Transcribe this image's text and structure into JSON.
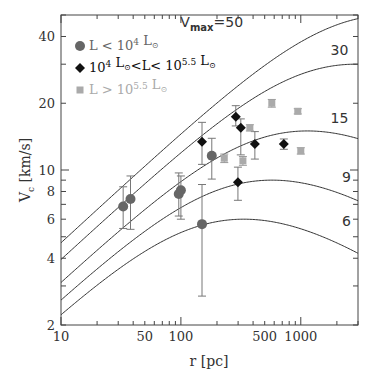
{
  "chart_data": {
    "type": "scatter",
    "title": "",
    "header_text_cropped": "James Bullock",
    "xlabel": "r [pc]",
    "ylabel": "V_c [km/s]",
    "xscale": "log",
    "yscale": "log",
    "xlim": [
      10,
      3000
    ],
    "ylim": [
      2,
      50
    ],
    "xticks": [
      10,
      50,
      100,
      500,
      1000
    ],
    "xtick_labels": [
      "10",
      "50",
      "100",
      "500",
      "1000"
    ],
    "yticks": [
      2,
      4,
      6,
      8,
      10,
      20,
      40
    ],
    "ytick_labels": [
      "2",
      "4",
      "6",
      "8",
      "10",
      "20",
      "40"
    ],
    "grid": false,
    "legend_position": "top-left",
    "series": [
      {
        "name": "L < 10^4 L_sun",
        "legend_parts": [
          "L < 10",
          "4",
          " L",
          "⊙"
        ],
        "marker": "circle",
        "color": "#666666",
        "points": [
          {
            "x": 33,
            "y": 6.85,
            "ylo": 5.45,
            "yhi": 8.4
          },
          {
            "x": 38,
            "y": 7.4,
            "ylo": 5.4,
            "yhi": 9.4
          },
          {
            "x": 96,
            "y": 7.8,
            "ylo": 6.2,
            "yhi": 9.7
          },
          {
            "x": 100,
            "y": 8.1,
            "ylo": 6.0,
            "yhi": 9.4
          },
          {
            "x": 150,
            "y": 5.7,
            "ylo": 2.7,
            "yhi": 8.6
          },
          {
            "x": 181,
            "y": 11.6,
            "ylo": 9.1,
            "yhi": 13.9
          }
        ]
      },
      {
        "name": "10^4 L_sun < L < 10^5.5 L_sun",
        "legend_parts": [
          "10",
          "4",
          " L",
          "⊙",
          "<L< 10",
          "5.5",
          " L",
          "⊙"
        ],
        "marker": "diamond",
        "color": "#111111",
        "points": [
          {
            "x": 150,
            "y": 13.4,
            "ylo": 10.6,
            "yhi": 16.4
          },
          {
            "x": 287,
            "y": 17.4,
            "ylo": 15.8,
            "yhi": 19.5
          },
          {
            "x": 316,
            "y": 15.5,
            "ylo": 11.7,
            "yhi": 17.0
          },
          {
            "x": 299,
            "y": 8.8,
            "ylo": 7.3,
            "yhi": 10.3
          },
          {
            "x": 414,
            "y": 13.1,
            "ylo": 11.2,
            "yhi": 14.9
          },
          {
            "x": 722,
            "y": 13.1,
            "ylo": 12.4,
            "yhi": 13.8
          }
        ]
      },
      {
        "name": "L > 10^5.5 L_sun",
        "legend_parts": [
          "L > 10",
          "5.5",
          " L",
          "⊙"
        ],
        "marker": "square",
        "color": "#aaaaaa",
        "points": [
          {
            "x": 230,
            "y": 11.3,
            "ylo": 10.8,
            "yhi": 11.8
          },
          {
            "x": 329,
            "y": 11.0,
            "ylo": 10.5,
            "yhi": 11.5
          },
          {
            "x": 376,
            "y": 15.5,
            "ylo": 15.0,
            "yhi": 16.0
          },
          {
            "x": 573,
            "y": 20.0,
            "ylo": 19.2,
            "yhi": 20.8
          },
          {
            "x": 944,
            "y": 18.4,
            "ylo": 17.9,
            "yhi": 18.9
          },
          {
            "x": 1000,
            "y": 12.2,
            "ylo": 11.8,
            "yhi": 12.6
          }
        ]
      }
    ],
    "curves": [
      {
        "vmax": 50,
        "rmax_pc": 5640,
        "label": "=50",
        "label_prefix": "V",
        "label_sub": "max",
        "label_at": [
          330,
          44
        ]
      },
      {
        "vmax": 30,
        "rmax_pc": 2860,
        "label": "30",
        "label_at": [
          2100,
          33
        ]
      },
      {
        "vmax": 15,
        "rmax_pc": 1135,
        "label": "15",
        "label_at": [
          2100,
          16.3
        ]
      },
      {
        "vmax": 9,
        "rmax_pc": 575,
        "label": "9",
        "label_at": [
          2400,
          8.8
        ]
      },
      {
        "vmax": 6,
        "rmax_pc": 335,
        "label": "6",
        "label_at": [
          2400,
          5.6
        ]
      }
    ],
    "curve_model": "NFW rotation curve: V(r) = Vmax * sqrt(4.6257 * (ln(1+x) - x/(1+x)) / x), x = 2.163 r / rmax"
  }
}
